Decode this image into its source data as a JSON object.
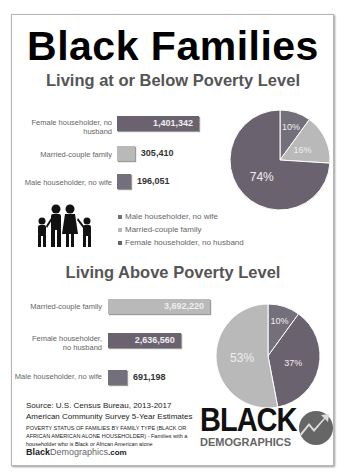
{
  "title": "Black Families",
  "section1": {
    "title": "Living at or Below Poverty Level"
  },
  "section2": {
    "title": "Living Above Poverty Level"
  },
  "colors": {
    "female": "#6b6270",
    "married": "#b9b9b9",
    "male": "#74707b"
  },
  "chart_data": [
    {
      "type": "bar",
      "title": "Living at or Below Poverty Level",
      "categories": [
        "Female householder, no husband",
        "Married-couple family",
        "Male householder, no wife"
      ],
      "values": [
        1401342,
        305410,
        196051
      ],
      "value_labels": [
        "1,401,342",
        "305,410",
        "196,051"
      ]
    },
    {
      "type": "pie",
      "title": "Living at or Below Poverty Level",
      "categories": [
        "Male householder, no wife",
        "Married-couple family",
        "Female householder, no husband"
      ],
      "values": [
        10,
        16,
        74
      ],
      "labels": [
        "10%",
        "16%",
        "74%"
      ]
    },
    {
      "type": "bar",
      "title": "Living Above Poverty Level",
      "categories": [
        "Married-couple family",
        "Female householder, no husband",
        "Male householder, no wife"
      ],
      "values": [
        3692220,
        2636560,
        691198
      ],
      "value_labels": [
        "3,692,220",
        "2,636,560",
        "691,198"
      ]
    },
    {
      "type": "pie",
      "title": "Living Above Poverty Level",
      "categories": [
        "Male householder, no wife",
        "Female householder, no husband",
        "Married-couple family"
      ],
      "values": [
        10,
        37,
        53
      ],
      "labels": [
        "10%",
        "37%",
        "53%"
      ]
    }
  ],
  "legend": [
    "Male householder, no wife",
    "Married-couple family",
    "Female householder, no husband"
  ],
  "bar1_labels": [
    "Female householder, no husband",
    "Married-couple family",
    "Male householder, no wife"
  ],
  "bar2_labels": [
    "Married-couple family",
    "Female householder, no husband",
    "Male householder, no wife"
  ],
  "source": {
    "line1": "Source: U.S. Census Bureau, 2013-2017",
    "line2": "American Community Survey 5-Year Estimates",
    "note": "POVERTY STATUS OF FAMILIES BY FAMILY TYPE (BLACK OR AFRICAN AMERICAN ALONE HOUSEHOLDER) - Families with a householder who is Black or African American alone",
    "site_bold": "Black",
    "site_rest": "Demographics",
    ".com": ".com"
  },
  "logo": {
    "top": "BLACK",
    "bottom": "DEMOGRAPHICS"
  }
}
